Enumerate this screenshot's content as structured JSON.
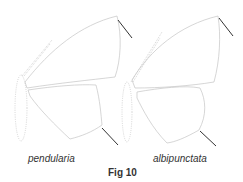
{
  "figure": {
    "caption": "Fig 10",
    "specimens": [
      {
        "label": "pendularia"
      },
      {
        "label": "albipunctata"
      }
    ],
    "colors": {
      "outline": "#bdbdbd",
      "pointer": "#333333",
      "text": "#333333"
    }
  }
}
